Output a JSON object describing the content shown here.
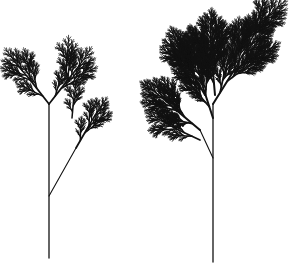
{
  "figure": {
    "width": 303,
    "height": 268,
    "background": "#ffffff",
    "ink_color": "#111111"
  },
  "trees": [
    {
      "id": "left-tree",
      "description": "Sparse fractal (L-system) tree",
      "trunk": {
        "x1": 49,
        "y1": 258,
        "x2": 49,
        "y2": 104,
        "width": 1.3
      },
      "lower_branch": {
        "from": [
          49,
          196
        ],
        "to": [
          76,
          148
        ],
        "width": 1.1
      },
      "crowns": [
        {
          "origin": [
            49,
            104
          ],
          "angle": -128,
          "length": 30,
          "depth": 5,
          "spread": 26,
          "ratio": 0.62,
          "seed": 3
        },
        {
          "origin": [
            49,
            104
          ],
          "angle": -52,
          "length": 30,
          "depth": 5,
          "spread": 26,
          "ratio": 0.62,
          "seed": 7
        },
        {
          "origin": [
            66,
            80
          ],
          "angle": -88,
          "length": 20,
          "depth": 4,
          "spread": 28,
          "ratio": 0.62,
          "seed": 11
        },
        {
          "origin": [
            76,
            148
          ],
          "angle": -60,
          "length": 26,
          "depth": 5,
          "spread": 27,
          "ratio": 0.6,
          "seed": 13
        },
        {
          "origin": [
            72,
            118
          ],
          "angle": -85,
          "length": 18,
          "depth": 4,
          "spread": 28,
          "ratio": 0.6,
          "seed": 17
        }
      ]
    },
    {
      "id": "right-tree",
      "description": "Dense, asymmetric fractal (L-system) tree",
      "trunk": {
        "x1": 213,
        "y1": 262,
        "x2": 213,
        "y2": 104,
        "width": 1.3
      },
      "lower_branch": {
        "from": [
          213,
          158
        ],
        "to": [
          200,
          130
        ],
        "width": 1.1
      },
      "crowns": [
        {
          "origin": [
            213,
            104
          ],
          "angle": -58,
          "length": 40,
          "depth": 6,
          "spread": 22,
          "ratio": 0.66,
          "seed": 21
        },
        {
          "origin": [
            236,
            52
          ],
          "angle": -50,
          "length": 30,
          "depth": 5,
          "spread": 24,
          "ratio": 0.64,
          "seed": 23
        },
        {
          "origin": [
            213,
            118
          ],
          "angle": -108,
          "length": 36,
          "depth": 6,
          "spread": 22,
          "ratio": 0.66,
          "seed": 29
        },
        {
          "origin": [
            200,
            130
          ],
          "angle": -140,
          "length": 30,
          "depth": 6,
          "spread": 24,
          "ratio": 0.64,
          "seed": 31
        },
        {
          "origin": [
            205,
            95
          ],
          "angle": -120,
          "length": 30,
          "depth": 6,
          "spread": 24,
          "ratio": 0.64,
          "seed": 37
        },
        {
          "origin": [
            200,
            140
          ],
          "angle": -155,
          "length": 26,
          "depth": 5,
          "spread": 24,
          "ratio": 0.62,
          "seed": 41
        },
        {
          "origin": [
            215,
            95
          ],
          "angle": -95,
          "length": 34,
          "depth": 6,
          "spread": 22,
          "ratio": 0.64,
          "seed": 43
        }
      ]
    }
  ]
}
